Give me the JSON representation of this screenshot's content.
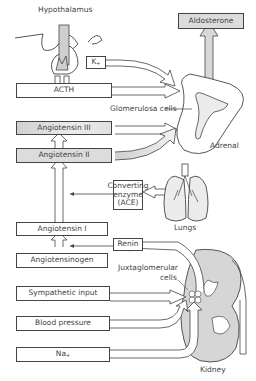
{
  "diagram": {
    "type": "renin-angiotensin-aldosterone pathway",
    "labels": {
      "hypothalamus": "Hypothalamus",
      "aldosterone": "Aldosterone",
      "potassium": "K",
      "potassium_sup": "+",
      "acth": "ACTH",
      "glomerulosa": "Glomerulosa cells",
      "adrenal": "Adrenal",
      "angiotensin_iii": "Angiotensin III",
      "angiotensin_ii": "Angiotensin II",
      "ace_line1": "Converting",
      "ace_line2": "enzyme",
      "ace_line3": "(ACE)",
      "lungs": "Lungs",
      "angiotensin_i": "Angiotensin I",
      "renin": "Renin",
      "angiotensinogen": "Angiotensinogen",
      "juxta_line1": "Juxtaglomerular",
      "juxta_line2": "cells",
      "sympathetic": "Sympathetic input",
      "blood_pressure": "Blood pressure",
      "sodium": "Na",
      "sodium_sup": "+",
      "kidney": "Kidney"
    },
    "colors": {
      "stroke": "#444444",
      "shade": "#d8d8d8",
      "light_shade": "#e8e8e8",
      "background": "#ffffff"
    }
  }
}
